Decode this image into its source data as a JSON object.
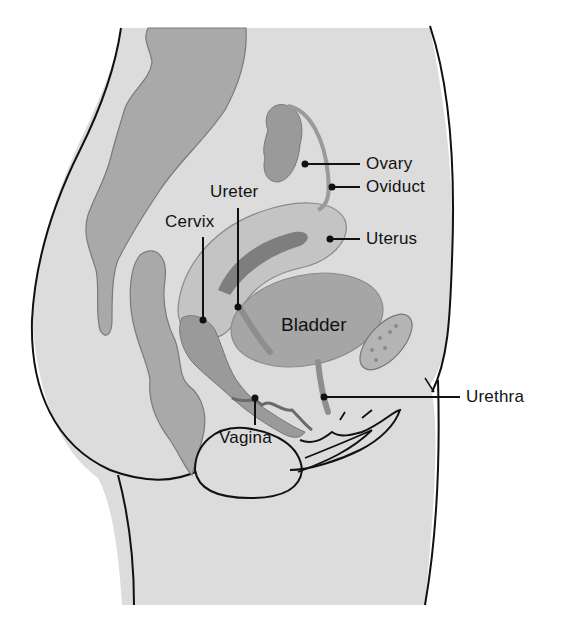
{
  "figure": {
    "colors": {
      "background": "#ffffff",
      "skin": "#dcdcdc",
      "outline": "#111111",
      "intestine": "#a9a9a9",
      "uterus": "#c4c4c4",
      "uterus_cavity": "#7e7e7e",
      "bladder": "#a6a6a6",
      "ovary": "#9a9a9a",
      "pubic_bone": "#b4b4b4",
      "vagina": "#8f8f8f"
    },
    "labels": {
      "ovary": "Ovary",
      "oviduct": "Oviduct",
      "ureter": "Ureter",
      "cervix": "Cervix",
      "uterus": "Uterus",
      "bladder": "Bladder",
      "urethra": "Urethra",
      "vagina": "Vagina"
    }
  }
}
